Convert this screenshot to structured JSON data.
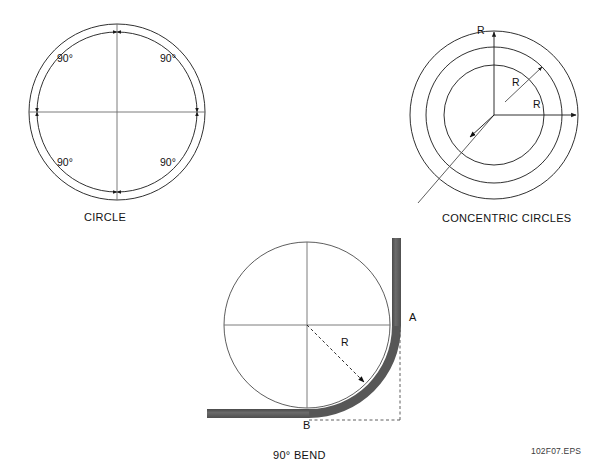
{
  "page": {
    "background": "#ffffff",
    "ink": "#1a1a1a",
    "pipe_fill": "#575757",
    "file_id": "102F07.EPS"
  },
  "figures": [
    {
      "id": "circle",
      "caption": "CIRCLE",
      "center": [
        117,
        112
      ],
      "outer_radius": 88,
      "inner_radius": 80,
      "angle_labels": [
        {
          "text": "90°",
          "quadrant": "upper-left",
          "x": 57,
          "y": 57
        },
        {
          "text": "90°",
          "quadrant": "upper-right",
          "x": 160,
          "y": 57
        },
        {
          "text": "90°",
          "quadrant": "lower-left",
          "x": 57,
          "y": 160
        },
        {
          "text": "90°",
          "quadrant": "lower-right",
          "x": 160,
          "y": 160
        }
      ],
      "arc_arrow_count": 8
    },
    {
      "id": "concentric",
      "caption": "CONCENTRIC CIRCLES",
      "center": [
        494,
        115
      ],
      "radii": [
        50,
        68,
        84
      ],
      "radius_labels": [
        {
          "text": "R",
          "direction": "up",
          "x": 477,
          "y": 29
        },
        {
          "text": "R",
          "direction": "diagonal",
          "x": 512,
          "y": 81
        },
        {
          "text": "R",
          "direction": "right",
          "x": 533,
          "y": 103
        }
      ]
    },
    {
      "id": "bend",
      "caption": "90° BEND",
      "center": [
        307,
        325
      ],
      "radius": 83,
      "radius_label": {
        "text": "R",
        "x": 341,
        "y": 341
      },
      "point_labels": [
        {
          "text": "A",
          "x": 409,
          "y": 317
        },
        {
          "text": "B",
          "x": 303,
          "y": 423
        }
      ],
      "pipe_thickness": 9
    }
  ]
}
